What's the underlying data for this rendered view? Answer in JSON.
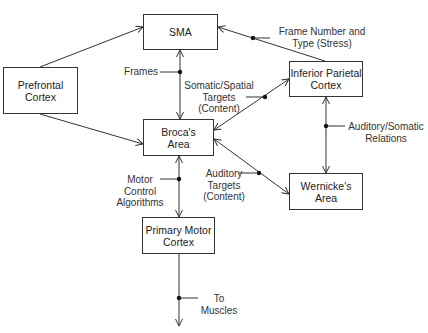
{
  "nodes": {
    "sma": "SMA",
    "prefrontal": "Prefrontal\nCortex",
    "broca": "Broca's\nArea",
    "inferior_parietal": "Inferior Parietal\nCortex",
    "wernicke": "Wernicke's\nArea",
    "primary_motor": "Primary Motor\nCortex"
  },
  "edge_labels": {
    "frames": "Frames",
    "frame_number": "Frame Number and\nType (Stress)",
    "somatic_spatial": "Somatic/Spatial\nTargets\n(Content)",
    "auditory_somatic": "Auditory/Somatic\nRelations",
    "auditory_targets": "Auditory\nTargets\n(Content)",
    "motor_control": "Motor\nControl\nAlgorithms",
    "to_muscles": "To\nMuscles"
  }
}
